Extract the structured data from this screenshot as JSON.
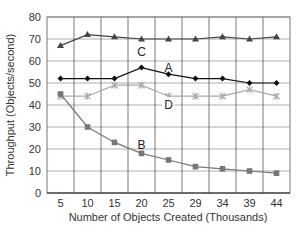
{
  "chart_data": {
    "type": "line",
    "title": "",
    "xlabel": "Number of Objects Created (Thousands)",
    "ylabel": "Throughput (Objects/second)",
    "categories": [
      "5",
      "10",
      "15",
      "20",
      "25",
      "29",
      "34",
      "39",
      "44"
    ],
    "ylim": [
      0,
      80
    ],
    "yticks": [
      0,
      10,
      20,
      30,
      40,
      50,
      60,
      70,
      80
    ],
    "grid": true,
    "legend": "inline labels",
    "series": [
      {
        "name": "C",
        "marker": "triangle",
        "color": "#444444",
        "values": [
          67,
          72,
          71,
          70,
          70,
          70,
          71,
          70,
          71
        ],
        "label_at": {
          "index": 3,
          "value": 63
        }
      },
      {
        "name": "A",
        "marker": "diamond",
        "color": "#111111",
        "values": [
          52,
          52,
          52,
          57,
          54,
          52,
          52,
          50,
          50
        ],
        "label_at": {
          "index": 4,
          "value": 56
        }
      },
      {
        "name": "D",
        "marker": "x",
        "color": "#aaaaaa",
        "values": [
          44,
          44,
          49,
          49,
          44,
          44,
          44,
          47,
          44
        ],
        "label_at": {
          "index": 4,
          "value": 39
        }
      },
      {
        "name": "B",
        "marker": "square",
        "color": "#777777",
        "values": [
          45,
          30,
          23,
          18,
          15,
          12,
          11,
          10,
          9
        ],
        "label_at": {
          "index": 3,
          "value": 21
        }
      }
    ]
  }
}
